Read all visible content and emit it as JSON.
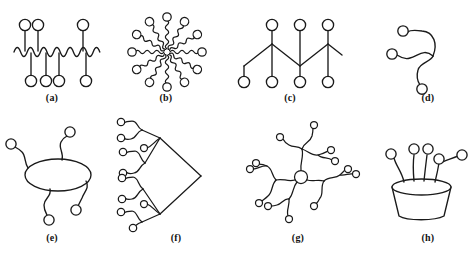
{
  "figure": {
    "title": "",
    "background_color": "#ffffff",
    "stroke_color": "#1a1a1a",
    "node_fill": "#ffffff",
    "width": 476,
    "height": 254
  },
  "captions": [
    {
      "id": "a",
      "label": "(a)",
      "x": 32,
      "y": 92,
      "structure": "linear-comb-wavy-backbone"
    },
    {
      "id": "b",
      "label": "(b)",
      "x": 146,
      "y": 92,
      "structure": "star-radial-12-arms"
    },
    {
      "id": "c",
      "label": "(c)",
      "x": 270,
      "y": 92,
      "structure": "linear-zigzag-pendant"
    },
    {
      "id": "d",
      "label": "(d)",
      "x": 408,
      "y": 92,
      "structure": "three-arm-branch"
    },
    {
      "id": "e",
      "label": "(e)",
      "x": 32,
      "y": 232,
      "structure": "macrocycle-with-arms"
    },
    {
      "id": "f",
      "label": "(f)",
      "x": 156,
      "y": 232,
      "structure": "dendron-binary-tree"
    },
    {
      "id": "g",
      "label": "(g)",
      "x": 278,
      "y": 232,
      "structure": "hyperbranched-star"
    },
    {
      "id": "h",
      "label": "(h)",
      "x": 408,
      "y": 232,
      "structure": "calixarene-cup"
    }
  ],
  "panels": {
    "a": {
      "name": "panel-a",
      "description": "Wavy horizontal backbone with pendant circles above and below",
      "backbone_y": 52,
      "pendants_up": [
        25,
        38,
        83
      ],
      "pendants_down": [
        31,
        46,
        59,
        86
      ],
      "node_radius": 5.5
    },
    "b": {
      "name": "panel-b",
      "description": "Radial star with twelve wavy arms from a central core",
      "center": [
        167,
        52
      ],
      "arm_count": 12,
      "arm_length": 33,
      "node_radius": 4.2
    },
    "c": {
      "name": "panel-c",
      "description": "Straight zigzag backbone with alternating pendant circles",
      "backbone_mid_y": 55,
      "amplitude": 11,
      "pendants_up": 3,
      "pendants_down": 4,
      "node_radius": 5.5
    },
    "d": {
      "name": "panel-d",
      "description": "Three-arm branched chain with curved arms and terminal circles",
      "junction": [
        432,
        56
      ],
      "arm_count": 3,
      "node_radius": 5.0
    },
    "e": {
      "name": "panel-e",
      "description": "Macrocyclic ring bearing four wavy pendant arms",
      "ring_center": [
        58,
        175
      ],
      "ring_rx": 33,
      "ring_ry": 16,
      "arm_count": 4,
      "node_radius": 5.0
    },
    "f": {
      "name": "panel-f",
      "description": "Dendron: binary branching tree with wavy terminal groups",
      "apex": [
        201,
        176
      ],
      "generations": 3,
      "terminal_count": 12,
      "node_radius": 3.6
    },
    "g": {
      "name": "panel-g",
      "description": "Hyperbranched star polymer with central core and branched wavy arms",
      "core": [
        301,
        177
      ],
      "core_radius": 6.5,
      "arm_count": 4,
      "node_radius": 3.4
    },
    "h": {
      "name": "panel-h",
      "description": "Cup shaped calixarene host with upward arms and terminal circles",
      "rim_center": [
        421,
        187
      ],
      "rim_rx": 29,
      "rim_ry": 8,
      "base_half_width": 22,
      "base_y": 218,
      "arm_count": 5,
      "node_radius": 5.0
    }
  }
}
